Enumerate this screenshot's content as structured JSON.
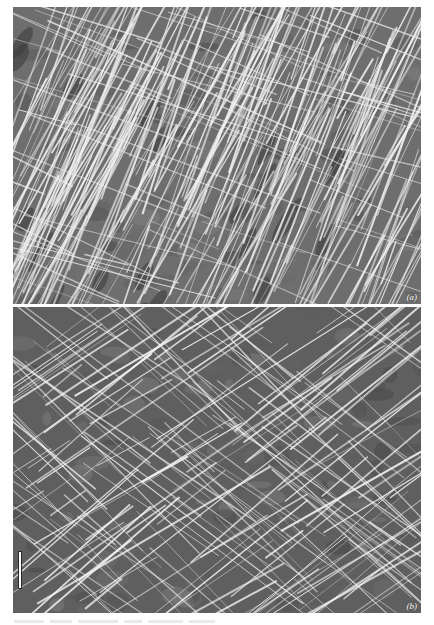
{
  "figure": {
    "panels": [
      {
        "id": "a",
        "label": "(a)",
        "description": "SEM micrograph of fibrous mesh with fibres predominantly aligned diagonally (lower-left to upper-right)",
        "texture": {
          "background": "#6e6e6e",
          "fibre_color": "#f0f0f0",
          "dominant_angle_deg": -65,
          "secondary_angle_deg": 20,
          "dominant_count": 260,
          "secondary_count": 60,
          "dark_patches": 40
        }
      },
      {
        "id": "b",
        "label": "(b)",
        "description": "SEM micrograph of fibrous mesh with crossed (crosshatch) fibre orientation",
        "texture": {
          "background": "#5f5f5f",
          "fibre_color": "#f5f5f5",
          "dominant_angle_deg": -35,
          "secondary_angle_deg": 40,
          "dominant_count": 110,
          "secondary_count": 100,
          "dark_patches": 0
        },
        "scale_bar": true
      }
    ],
    "caption_fragment_visible": true
  }
}
